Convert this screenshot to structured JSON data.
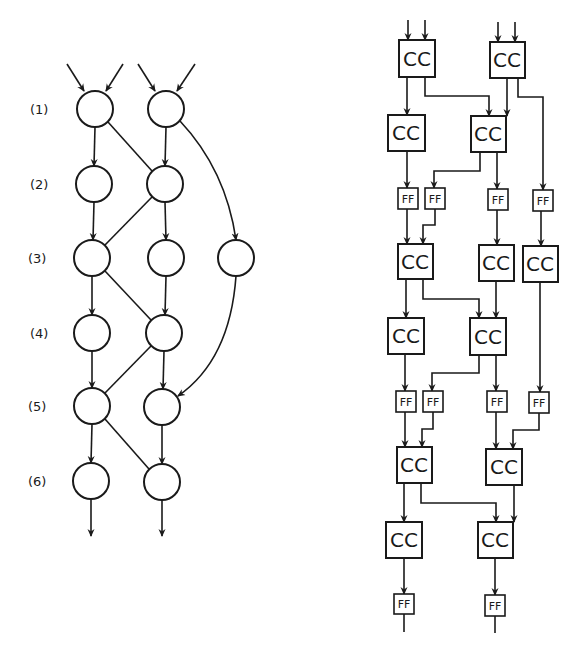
{
  "diagram": {
    "left": {
      "title": "Dependence graph (node levels)",
      "level_labels": [
        "(1)",
        "(2)",
        "(3)",
        "(4)",
        "(5)",
        "(6)"
      ],
      "nodes": [
        {
          "id": "n1a",
          "level": 1,
          "x": 95,
          "y": 109
        },
        {
          "id": "n1b",
          "level": 1,
          "x": 166,
          "y": 109
        },
        {
          "id": "n2a",
          "level": 2,
          "x": 94,
          "y": 184
        },
        {
          "id": "n2b",
          "level": 2,
          "x": 165,
          "y": 184
        },
        {
          "id": "n3a",
          "level": 3,
          "x": 92,
          "y": 258
        },
        {
          "id": "n3b",
          "level": 3,
          "x": 166,
          "y": 258
        },
        {
          "id": "n3c",
          "level": 3,
          "x": 236,
          "y": 258
        },
        {
          "id": "n4a",
          "level": 4,
          "x": 92,
          "y": 333
        },
        {
          "id": "n4b",
          "level": 4,
          "x": 164,
          "y": 333
        },
        {
          "id": "n5a",
          "level": 5,
          "x": 92,
          "y": 406
        },
        {
          "id": "n5b",
          "level": 5,
          "x": 162,
          "y": 407
        },
        {
          "id": "n6a",
          "level": 6,
          "x": 91,
          "y": 481
        },
        {
          "id": "n6b",
          "level": 6,
          "x": 162,
          "y": 482
        }
      ],
      "edges": [
        [
          "n1a",
          "n2a"
        ],
        [
          "n1a",
          "n2b"
        ],
        [
          "n1b",
          "n2b"
        ],
        [
          "n1b",
          "n3c"
        ],
        [
          "n2a",
          "n3a"
        ],
        [
          "n2b",
          "n3a"
        ],
        [
          "n2b",
          "n3b"
        ],
        [
          "n3a",
          "n4a"
        ],
        [
          "n3a",
          "n4b"
        ],
        [
          "n3b",
          "n4b"
        ],
        [
          "n3c",
          "n5b"
        ],
        [
          "n4a",
          "n5a"
        ],
        [
          "n4b",
          "n5a"
        ],
        [
          "n4b",
          "n5b"
        ],
        [
          "n5a",
          "n6a"
        ],
        [
          "n5a",
          "n6b"
        ],
        [
          "n5b",
          "n6b"
        ]
      ]
    },
    "right": {
      "title": "Pipelined circuit",
      "cc_label": "CC",
      "ff_label": "FF",
      "cc_blocks": [
        {
          "id": "cc1a",
          "x": 399,
          "y": 40
        },
        {
          "id": "cc1b",
          "x": 490,
          "y": 42
        },
        {
          "id": "cc2a",
          "x": 388,
          "y": 115
        },
        {
          "id": "cc2b",
          "x": 471,
          "y": 116
        },
        {
          "id": "cc3a",
          "x": 398,
          "y": 244
        },
        {
          "id": "cc3b",
          "x": 479,
          "y": 245
        },
        {
          "id": "cc3c",
          "x": 523,
          "y": 246
        },
        {
          "id": "cc4a",
          "x": 388,
          "y": 318
        },
        {
          "id": "cc4b",
          "x": 470,
          "y": 318
        },
        {
          "id": "cc5a",
          "x": 397,
          "y": 447
        },
        {
          "id": "cc5b",
          "x": 486,
          "y": 449
        },
        {
          "id": "cc6a",
          "x": 386,
          "y": 522
        },
        {
          "id": "cc6b",
          "x": 478,
          "y": 522
        }
      ],
      "ff_blocks": [
        {
          "id": "ff1a",
          "x": 398,
          "y": 188
        },
        {
          "id": "ff1b",
          "x": 425,
          "y": 188
        },
        {
          "id": "ff1c",
          "x": 488,
          "y": 189
        },
        {
          "id": "ff1d",
          "x": 533,
          "y": 190
        },
        {
          "id": "ff2a",
          "x": 396,
          "y": 391
        },
        {
          "id": "ff2b",
          "x": 423,
          "y": 391
        },
        {
          "id": "ff2c",
          "x": 487,
          "y": 391
        },
        {
          "id": "ff2d",
          "x": 529,
          "y": 392
        },
        {
          "id": "ff3a",
          "x": 394,
          "y": 594
        },
        {
          "id": "ff3b",
          "x": 485,
          "y": 595
        }
      ]
    }
  }
}
